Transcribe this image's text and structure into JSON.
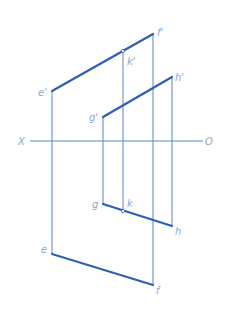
{
  "diagram": {
    "type": "orthographic-projection",
    "colors": {
      "thick_line": "#2f5fb5",
      "thin_line": "#5a82c8",
      "label": "#8aa6d6",
      "background": "#ffffff"
    },
    "axis": {
      "left_label": "X",
      "right_label": "O",
      "x1": 30,
      "x2": 203,
      "y": 141,
      "left_label_pos": [
        18,
        145
      ],
      "right_label_pos": [
        205,
        145
      ]
    },
    "points": {
      "e_prime": {
        "label": "e'",
        "x": 52,
        "y": 91,
        "lx": 38,
        "ly": 96
      },
      "f_prime": {
        "label": "f'",
        "x": 153,
        "y": 34,
        "lx": 157,
        "ly": 36
      },
      "k_prime": {
        "label": "k'",
        "x": 123,
        "y": 51,
        "lx": 127,
        "ly": 65
      },
      "g_prime": {
        "label": "g'",
        "x": 103,
        "y": 117,
        "lx": 89,
        "ly": 121
      },
      "h_prime": {
        "label": "h'",
        "x": 172,
        "y": 77,
        "lx": 175,
        "ly": 81
      },
      "e": {
        "label": "e",
        "x": 52,
        "y": 254,
        "lx": 41,
        "ly": 253
      },
      "f": {
        "label": "f",
        "x": 153,
        "y": 285,
        "lx": 156,
        "ly": 294
      },
      "g": {
        "label": "g",
        "x": 103,
        "y": 204,
        "lx": 92,
        "ly": 208
      },
      "k": {
        "label": "k",
        "x": 123,
        "y": 211,
        "lx": 127,
        "ly": 207
      },
      "h": {
        "label": "h",
        "x": 172,
        "y": 226,
        "lx": 175,
        "ly": 235
      }
    },
    "thick_segments": [
      [
        "e_prime",
        "f_prime"
      ],
      [
        "g_prime",
        "h_prime"
      ],
      [
        "g",
        "h"
      ],
      [
        "e",
        "f"
      ]
    ],
    "thin_segments": [
      [
        "e_prime",
        "e"
      ],
      [
        "f_prime",
        "f"
      ],
      [
        "g_prime",
        "g"
      ],
      [
        "h_prime",
        "h"
      ],
      [
        "k_prime",
        "k"
      ]
    ],
    "marker_points": [
      "k_prime",
      "k"
    ]
  }
}
